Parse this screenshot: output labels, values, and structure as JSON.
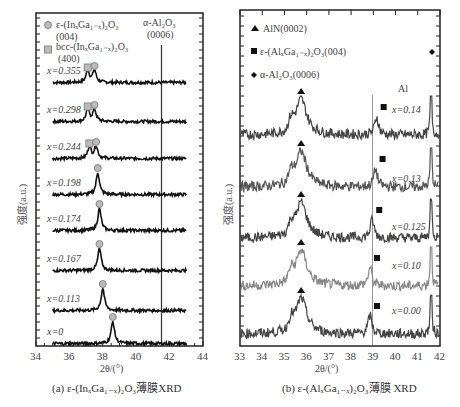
{
  "chart_data": [
    {
      "type": "line",
      "title": "(a) ε-(InₓGa₁₋ₓ)₂O₃薄膜XRD",
      "xlabel": "2θ/(°)",
      "ylabel": "强度(a.u.)",
      "xlim": [
        34,
        44
      ],
      "xticks": [
        34,
        36,
        38,
        40,
        42,
        44
      ],
      "stacked_offset": true,
      "grid": false,
      "legend": [
        {
          "marker": "circle-gray",
          "label": "ε-(InₓGa₁₋ₓ)₂O₃ (004)"
        },
        {
          "marker": "square-gray",
          "label": "bcc-(InₓGa₁₋ₓ)₂O₃ (400)"
        }
      ],
      "annotations": [
        {
          "text": "α-Al₂O₃ (0006)",
          "x": 41.7
        }
      ],
      "substrate_peak_x": 41.7,
      "series": [
        {
          "name": "x=0.355",
          "peaks": [
            {
              "x": 37.1,
              "phase": "bcc(400)"
            },
            {
              "x": 37.5,
              "phase": "ε(004)"
            }
          ]
        },
        {
          "name": "x=0.298",
          "peaks": [
            {
              "x": 37.1,
              "phase": "bcc(400)"
            },
            {
              "x": 37.5,
              "phase": "ε(004)"
            }
          ]
        },
        {
          "name": "x=0.244",
          "peaks": [
            {
              "x": 37.2,
              "phase": "bcc(400)"
            },
            {
              "x": 37.6,
              "phase": "ε(004)"
            }
          ]
        },
        {
          "name": "x=0.198",
          "peaks": [
            {
              "x": 37.7,
              "phase": "ε(004)"
            }
          ]
        },
        {
          "name": "x=0.174",
          "peaks": [
            {
              "x": 37.8,
              "phase": "ε(004)"
            }
          ]
        },
        {
          "name": "x=0.167",
          "peaks": [
            {
              "x": 37.8,
              "phase": "ε(004)"
            }
          ]
        },
        {
          "name": "x=0.113",
          "peaks": [
            {
              "x": 38.0,
              "phase": "ε(004)"
            }
          ]
        },
        {
          "name": "x=0",
          "peaks": [
            {
              "x": 38.6,
              "phase": "ε(004)"
            }
          ]
        }
      ]
    },
    {
      "type": "line",
      "title": "(b) ε-(AlₓGa₁₋ₓ)₂O₃薄膜 XRD",
      "xlabel": "2θ/(°)",
      "ylabel": "强度(a.u.)",
      "xlim": [
        33,
        42
      ],
      "xticks": [
        33,
        34,
        35,
        36,
        37,
        38,
        39,
        40,
        41,
        42
      ],
      "stacked_offset": true,
      "grid": false,
      "legend": [
        {
          "marker": "triangle-black",
          "label": "AlN(0002)"
        },
        {
          "marker": "square-black",
          "label": "ε-(AlₓGa₁₋ₓ)₂O₃(004)"
        },
        {
          "marker": "diamond-black",
          "label": "α-Al₂O₃(0006)"
        }
      ],
      "annotations": [
        {
          "text": "Al",
          "x": 41.0
        }
      ],
      "aln_peak_x": 35.75,
      "substrate_peak_x": 41.6,
      "series": [
        {
          "name": "x=0.14",
          "ga2o3_peak_x": 39.15
        },
        {
          "name": "x=0.13",
          "ga2o3_peak_x": 39.1
        },
        {
          "name": "x=0.125",
          "ga2o3_peak_x": 38.95
        },
        {
          "name": "x=0.10",
          "ga2o3_peak_x": 38.85
        },
        {
          "name": "x=0.00",
          "ga2o3_peak_x": 38.85
        }
      ]
    }
  ],
  "panel_a": {
    "legend1_line1": "ε-(InₓGa₁₋ₓ)₂O₃",
    "legend1_line2": "(004)",
    "legend2_line1": "bcc-(InₓGa₁₋ₓ)₂O₃",
    "legend2_line2": "(400)",
    "sub_line1": "α-Al₂O₃",
    "sub_line2": "(0006)",
    "xlabel": "2θ/(°)",
    "ylabel": "强度(a.u.)",
    "caption": "(a) ε-(InₓGa₁₋ₓ)₂O₃薄膜XRD",
    "ticks": [
      "34",
      "36",
      "38",
      "40",
      "42",
      "44"
    ],
    "labels": [
      "x=0.355",
      "x=0.298",
      "x=0.244",
      "x=0.198",
      "x=0.174",
      "x=0.167",
      "x=0.113",
      "x=0"
    ]
  },
  "panel_b": {
    "legend1": "AlN(0002)",
    "legend2": "ε-(AlₓGa₁₋ₓ)₂O₃(004)",
    "legend3": "α-Al₂O₃(0006)",
    "al_label": "Al",
    "xlabel": "2θ/(°)",
    "ylabel": "强度(a.u.)",
    "caption": "(b) ε-(AlₓGa₁₋ₓ)₂O₃薄膜 XRD",
    "ticks": [
      "33",
      "34",
      "35",
      "36",
      "37",
      "38",
      "39",
      "40",
      "41",
      "42"
    ],
    "labels": [
      "x=0.14",
      "x=0.13",
      "x=0.125",
      "x=0.10",
      "x=0.00"
    ]
  }
}
